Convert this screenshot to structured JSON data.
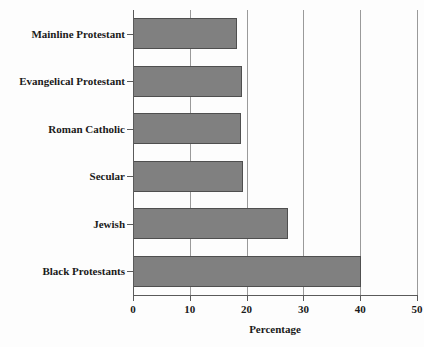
{
  "chart_data": {
    "type": "bar",
    "orientation": "horizontal",
    "title": "",
    "xlabel": "Percentage",
    "ylabel": "",
    "xlim": [
      0,
      50
    ],
    "xticks": [
      0,
      10,
      20,
      30,
      40,
      50
    ],
    "xtick_labels": [
      "0",
      "10",
      "20",
      "30",
      "40",
      "50"
    ],
    "grid": true,
    "grid_axis": "x",
    "legend": false,
    "categories": [
      "Mainline Protestant",
      "Evangelical Protestant",
      "Roman Catholic",
      "Secular",
      "Jewish",
      "Black Protestants"
    ],
    "values": [
      18.3,
      19.2,
      19.0,
      19.3,
      27.3,
      40.2
    ],
    "bar_color": "#808080",
    "bar_edge_color": "#4f4f4f",
    "background_color": "#fdfdfd",
    "axis_color": "#5a5a5a",
    "grid_color": "#9a9a9a",
    "text_color": "#1a1a1a"
  }
}
